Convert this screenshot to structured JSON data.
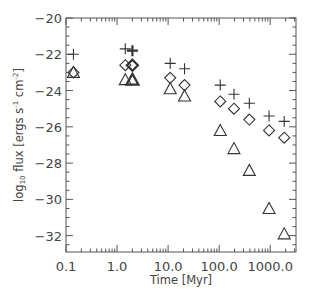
{
  "chart_data": {
    "type": "scatter",
    "title": "",
    "xlabel": "Time [Myr]",
    "ylabel_parts": {
      "log": "log",
      "sub": "10",
      "rest": " flux [ergs s",
      "s_exp": "-1",
      "mid": " cm",
      "cm_exp": "-2",
      "end": "]"
    },
    "ylabel": "log10 flux [ergs s^-1 cm^-2]",
    "xscale": "log",
    "xlim": [
      0.1,
      3200
    ],
    "ylim": [
      -32.9,
      -20.0
    ],
    "grid": false,
    "legend": null,
    "x_ticks": [
      {
        "value": 0.1,
        "label": "0.1"
      },
      {
        "value": 1,
        "label": "1.0"
      },
      {
        "value": 10,
        "label": "10.0"
      },
      {
        "value": 100,
        "label": "100.0"
      },
      {
        "value": 1000,
        "label": "1000.0"
      }
    ],
    "y_ticks": [
      {
        "value": -20,
        "label": "−20"
      },
      {
        "value": -22,
        "label": "−22"
      },
      {
        "value": -24,
        "label": "−24"
      },
      {
        "value": -26,
        "label": "−26"
      },
      {
        "value": -28,
        "label": "−28"
      },
      {
        "value": -30,
        "label": "−30"
      },
      {
        "value": -32,
        "label": "−32"
      }
    ],
    "series": [
      {
        "name": "plus",
        "marker": "plus",
        "points": [
          {
            "x": 0.14,
            "y": -22.0
          },
          {
            "x": 1.45,
            "y": -21.7
          },
          {
            "x": 2.0,
            "y": -21.8,
            "bold": true
          },
          {
            "x": 11,
            "y": -22.5
          },
          {
            "x": 21,
            "y": -22.8
          },
          {
            "x": 105,
            "y": -23.7
          },
          {
            "x": 195,
            "y": -24.2
          },
          {
            "x": 390,
            "y": -24.7
          },
          {
            "x": 950,
            "y": -25.4
          },
          {
            "x": 1880,
            "y": -25.7
          }
        ]
      },
      {
        "name": "diamond",
        "marker": "diamond",
        "points": [
          {
            "x": 0.14,
            "y": -23.0
          },
          {
            "x": 1.45,
            "y": -22.6
          },
          {
            "x": 2.0,
            "y": -22.6,
            "bold": true
          },
          {
            "x": 11,
            "y": -23.3
          },
          {
            "x": 21,
            "y": -23.7
          },
          {
            "x": 105,
            "y": -24.6
          },
          {
            "x": 195,
            "y": -25.0
          },
          {
            "x": 390,
            "y": -25.6
          },
          {
            "x": 950,
            "y": -26.2
          },
          {
            "x": 1880,
            "y": -26.6
          }
        ]
      },
      {
        "name": "triangle",
        "marker": "triangle",
        "points": [
          {
            "x": 0.14,
            "y": -23.0
          },
          {
            "x": 1.45,
            "y": -23.4
          },
          {
            "x": 2.0,
            "y": -23.4,
            "bold": true
          },
          {
            "x": 11,
            "y": -23.9
          },
          {
            "x": 21,
            "y": -24.3
          },
          {
            "x": 105,
            "y": -26.2
          },
          {
            "x": 195,
            "y": -27.2
          },
          {
            "x": 390,
            "y": -28.4
          },
          {
            "x": 950,
            "y": -30.5
          },
          {
            "x": 1880,
            "y": -31.9
          }
        ]
      }
    ]
  },
  "style": {
    "axis_color": "#555555",
    "marker_color": "#333333",
    "text_color": "#444444"
  }
}
